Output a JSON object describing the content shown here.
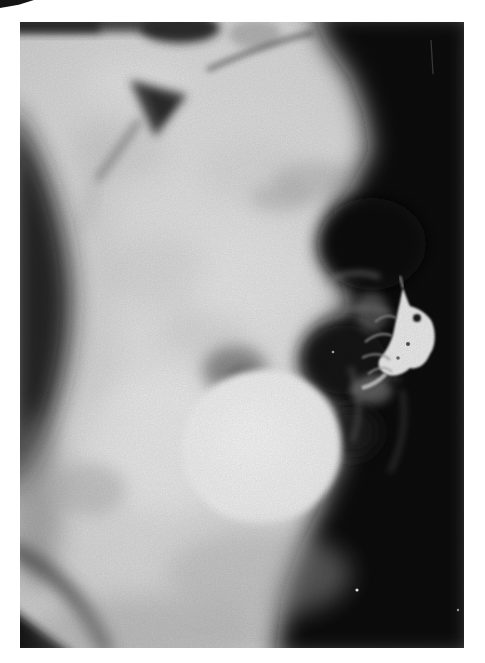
{
  "page": {
    "type": "photographed book page bearing a single radiograph",
    "background_color": "#ffffff",
    "artifact": {
      "name": "top-left-corner-mark",
      "description": "small black triangular printing artifact at the top-left corner of the page",
      "color": "#141414"
    }
  },
  "radiograph": {
    "modality": "x-ray film, black-and-white halftone reproduction",
    "view": "lateral view of the lower torso / pelvis with radiographic contrast",
    "frame": {
      "left": 20,
      "top": 22,
      "width": 444,
      "height": 626
    },
    "features": [
      {
        "name": "soft-tissue-field",
        "description": "light gray soft tissue filling the left and central torso"
      },
      {
        "name": "film-dark-background",
        "description": "large near-black background field occupying the right side of the film"
      },
      {
        "name": "contrast-filled-bladder",
        "description": "large bright white oval of contrast material, lower center"
      },
      {
        "name": "contrast-material-patch",
        "description": "irregular streaky bright patch of contrast with a dark speckle, mid-right, surrounded by gray lace-like strands"
      },
      {
        "name": "bowel-gas-shadows",
        "description": "rounded dark gas shadows along the posterior abdomen"
      },
      {
        "name": "upper-gas-triangle",
        "description": "triangular dark gas shadow with a thin tail, upper left-center"
      },
      {
        "name": "film-top-edge-band",
        "description": "dark exposure band along the top edge of the film"
      },
      {
        "name": "anterior-flank-shadow",
        "description": "dark wedge running down the left film edge"
      },
      {
        "name": "gluteal-fold-shadow",
        "description": "dark curved band at the bottom-left corner"
      },
      {
        "name": "white-specks",
        "description": "tiny white dust specks and a fine vertical scratch in the dark field"
      }
    ],
    "colors": {
      "film_black": "#101010",
      "deep_shadow": "#1a1a1a",
      "gas_shadow_dark": "#0d0d0d",
      "gas_shadow_mid": "#161616",
      "film_edge_band": "#383838",
      "soft_tissue_light": "#dedede",
      "tissue_highlight": "#f2f2f2",
      "shadow_gray": "#8f8f8f",
      "contrast_bright": "#f1f1f1"
    }
  }
}
